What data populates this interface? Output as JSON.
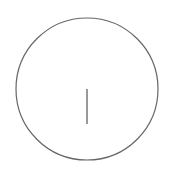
{
  "canvas": {
    "width": 171,
    "height": 170,
    "background": "#ffffff"
  },
  "shapes": {
    "circle": {
      "cx": 87,
      "cy": 89,
      "r": 71,
      "stroke": "#666666",
      "stroke_width": 1.2
    },
    "line": {
      "x1": 87,
      "y1": 89,
      "x2": 87,
      "y2": 124,
      "stroke": "#555555",
      "stroke_width": 1.2
    }
  }
}
